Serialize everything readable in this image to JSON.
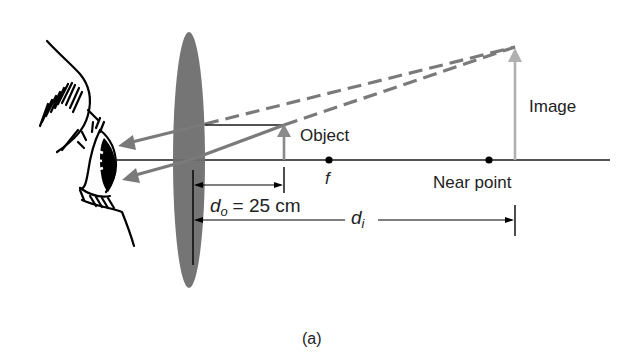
{
  "figure": {
    "caption": "(a)",
    "labels": {
      "object": "Object",
      "image": "Image",
      "focal_point": "f",
      "near_point": "Near point",
      "do_symbol": "d",
      "do_subscript": "o",
      "do_value": "= 25 cm",
      "di_symbol": "d",
      "di_subscript": "i"
    },
    "colors": {
      "lens": "#6e6e6e",
      "ray": "#7a7a7a",
      "object_arrow": "#8a8a8a",
      "image_arrow": "#b0b0b0",
      "axis": "#1a1a1a"
    }
  }
}
